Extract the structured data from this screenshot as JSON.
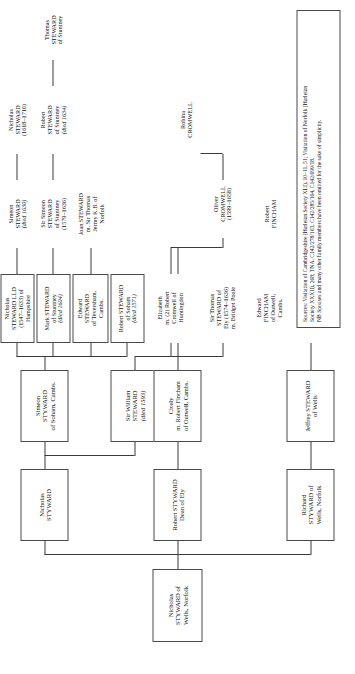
{
  "diagram": {
    "type": "genealogy-family-tree",
    "orientation": "rotated-90-left",
    "line_color": "#3b3b3b",
    "box_border_color": "#4a4a4a",
    "background": "#ffffff"
  },
  "nodes": {
    "root": {
      "id": "nicholas-styward-wells",
      "lines": [
        "Nicholas",
        "STYWARD of",
        "Wells, Norfolk"
      ],
      "boxed": true
    },
    "gen2": [
      {
        "id": "richard-styward-wells",
        "lines": [
          "Richard",
          "STYWARD of",
          "Wells, Norfolk"
        ],
        "boxed": true
      },
      {
        "id": "robert-styward-dean-of-ely",
        "lines": [
          "Robert STYWARD",
          "Dean of Ely"
        ],
        "boxed": true
      },
      {
        "id": "nicholas-styward",
        "lines": [
          "Nicholas",
          "STYWARD"
        ],
        "boxed": true
      }
    ],
    "gen3": [
      {
        "id": "jeffrey-steward-wells",
        "lines": [
          "Jeffrey STEWARD",
          "of Wells"
        ],
        "boxed": true
      },
      {
        "id": "cicely-fincham",
        "lines": [
          "Cicely",
          "m. Robert Fincham",
          "of Outwell, Cambs."
        ],
        "boxed": true
      },
      {
        "id": "sir-william-steward",
        "lines": [
          "Sir William",
          "STEWARD",
          "(died 1593)"
        ],
        "italic_lines": [
          2
        ],
        "boxed": true
      },
      {
        "id": "simeon-styward-soham",
        "lines": [
          "Simeon",
          "STYWARD",
          "of Soham, Cambs."
        ],
        "boxed": true
      }
    ],
    "gen4": [
      {
        "id": "arthur-steward-gestwyck",
        "lines": [
          "Arthur",
          "STEWARD",
          "of Gestwyck,",
          "Norfolk"
        ],
        "boxed": false
      },
      {
        "id": "edward-fincham-outwell",
        "lines": [
          "Edward",
          "FINCHAM",
          "of Outwell,",
          "Cambs."
        ],
        "boxed": false
      },
      {
        "id": "sir-thomas-steward-ely",
        "lines": [
          "Sir Thomas",
          "STEWARD of",
          "Ely (1574–1636)",
          "m. Bridget Poole"
        ],
        "boxed": false
      },
      {
        "id": "elizabeth-cromwell",
        "lines": [
          "Elizabeth",
          "m. (2) Robert",
          "Cromwell of",
          "Huntingdon"
        ],
        "boxed": false
      },
      {
        "id": "robert-steward-soham",
        "lines": [
          "Robert STEWARD",
          "of Soham",
          "(died 1571)"
        ],
        "italic_lines": [
          2
        ],
        "boxed": true
      },
      {
        "id": "edward-steward-teversham",
        "lines": [
          "Edward",
          "STEWARD",
          "of Teversham,",
          "Cambs."
        ],
        "boxed": true
      },
      {
        "id": "mark-steward-stuntney",
        "lines": [
          "Mark STEWARD",
          "of Stuntney",
          "(died 1604)"
        ],
        "italic_lines": [
          2
        ],
        "boxed": true
      },
      {
        "id": "nicholas-steward-lld-hampshire",
        "lines": [
          "Nicholas",
          "STEWARD LLD",
          "(1547–1633) of",
          "Hampshire"
        ],
        "boxed": true
      }
    ],
    "gen5": [
      {
        "id": "robert-fincham",
        "lines": [
          "Robert",
          "FINCHAM"
        ],
        "boxed": false
      },
      {
        "id": "oliver-cromwell",
        "lines": [
          "Oliver",
          "CROMWELL",
          "(1599–1658)"
        ],
        "boxed": false
      },
      {
        "id": "joan-steward-jermy",
        "lines": [
          "Joan STEWARD",
          "m. Sir Thomas",
          "Jermy K.B. of",
          "Norfolk"
        ],
        "boxed": false
      },
      {
        "id": "sir-simeon-steward-stuntney",
        "lines": [
          "Sir Simeon",
          "STEWARD",
          "of Stuntney",
          "(1579–1636)"
        ],
        "boxed": false
      },
      {
        "id": "simeon-steward",
        "lines": [
          "Simeon",
          "STEWARD",
          "(died 1630)"
        ],
        "italic_lines": [
          2
        ],
        "boxed": false
      }
    ],
    "gen6": [
      {
        "id": "robina-cromwell",
        "lines": [
          "Robina",
          "CROMWELL"
        ],
        "boxed": false
      },
      {
        "id": "robert-steward-stuntney",
        "lines": [
          "Robert",
          "STEWARD",
          "of Stuntney",
          "(died 1634)"
        ],
        "italic_lines": [
          3
        ],
        "boxed": false
      },
      {
        "id": "nicholas-steward-1618",
        "lines": [
          "Nicholas",
          "STEWARD",
          "(1618–1710)"
        ],
        "boxed": false
      }
    ],
    "gen7": [
      {
        "id": "thomas-steward-stuntney",
        "lines": [
          "Thomas",
          "STEWARD",
          "of Stuntney"
        ],
        "boxed": false
      }
    ]
  },
  "sources_note": {
    "line1": "Sources: Visitation of Cambridgeshire (Harleian Society XLI), 10–11, 51; Visitation of Norfolk (Harleian",
    "line2": "Society XXXII), 268; TNA, C142/278/103, C142/285/164, C142/699/18.",
    "line3": "NB Spouses and many other family members have been omitted for the sake of simplicity."
  }
}
